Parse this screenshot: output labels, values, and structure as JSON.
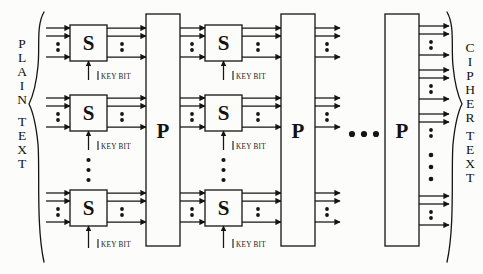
{
  "diagram": {
    "background_color": "#fcfcfa",
    "ink_color": "#141414",
    "width": 483,
    "height": 274,
    "input_label": "PLAINTEXT",
    "input_label_letters": [
      "P",
      "L",
      "A",
      "I",
      "N",
      "T",
      "E",
      "X",
      "T"
    ],
    "output_label": "CIPHERTEXT",
    "output_label_letters": [
      "C",
      "I",
      "P",
      "H",
      "E",
      "R",
      "T",
      "E",
      "X",
      "T"
    ],
    "sbox_label": "S",
    "pbox_label": "P",
    "keybit_label": "KEY BIT",
    "round_ellipsis": "...",
    "sbox_columns": 2,
    "pbox_columns": 3,
    "sbox_rows_per_column": 3,
    "keybit_arrows_per_column": 3,
    "wires_per_sbox": 3,
    "vertical_ellipsis_dots": 3,
    "horizontal_ellipsis_dots": 3,
    "sboxes": [
      {
        "column": 1,
        "row": 1,
        "label": "S",
        "x": 70,
        "y": 25,
        "w": 37,
        "h": 36
      },
      {
        "column": 1,
        "row": 2,
        "label": "S",
        "x": 70,
        "y": 95,
        "w": 37,
        "h": 36
      },
      {
        "column": 1,
        "row": 3,
        "label": "S",
        "x": 70,
        "y": 190,
        "w": 37,
        "h": 36
      },
      {
        "column": 2,
        "row": 1,
        "label": "S",
        "x": 205,
        "y": 25,
        "w": 37,
        "h": 36
      },
      {
        "column": 2,
        "row": 2,
        "label": "S",
        "x": 205,
        "y": 95,
        "w": 37,
        "h": 36
      },
      {
        "column": 2,
        "row": 3,
        "label": "S",
        "x": 205,
        "y": 190,
        "w": 37,
        "h": 36
      }
    ],
    "pboxes": [
      {
        "index": 1,
        "label": "P",
        "x": 146,
        "y": 14,
        "w": 34,
        "h": 232
      },
      {
        "index": 2,
        "label": "P",
        "x": 281,
        "y": 14,
        "w": 34,
        "h": 232
      },
      {
        "index": 3,
        "label": "P",
        "x": 385,
        "y": 14,
        "w": 34,
        "h": 232
      }
    ],
    "keybit_labels": [
      {
        "column": 1,
        "row": 1,
        "text": "KEY BIT"
      },
      {
        "column": 1,
        "row": 2,
        "text": "KEY BIT"
      },
      {
        "column": 1,
        "row": 3,
        "text": "KEY BIT"
      },
      {
        "column": 2,
        "row": 1,
        "text": "KEY BIT"
      },
      {
        "column": 2,
        "row": 2,
        "text": "KEY BIT"
      },
      {
        "column": 2,
        "row": 3,
        "text": "KEY BIT"
      }
    ]
  }
}
